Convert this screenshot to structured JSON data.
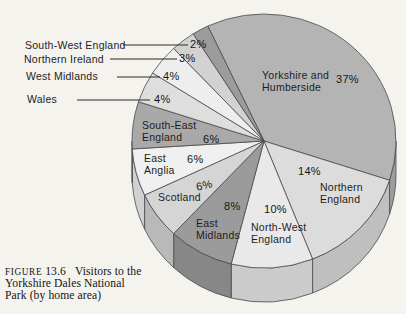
{
  "caption": {
    "figure_word": "FIGURE",
    "figure_number": "13.6",
    "line1": "Visitors to the",
    "line2": "Yorkshire Dales National",
    "line3": "Park (by home area)"
  },
  "chart_data": {
    "type": "pie",
    "style": "3d-extruded",
    "title": "Visitors to the Yorkshire Dales National Park (by home area)",
    "units": "percent of visitors",
    "start_angle_deg": -25.2,
    "depth_px": 34,
    "edge_stroke": "#4a4a4a",
    "leader_stroke": "#2b2b2b",
    "background": "#f5f3ee",
    "legend_position": "none",
    "segments": [
      {
        "name": "Yorkshire and Humberside",
        "value": 37,
        "pct": "37%",
        "color": "#b4b4b4",
        "label": {
          "lines": [
            "Yorkshire and",
            "Humberside"
          ],
          "x": 262,
          "y": 69
        },
        "pct_pos": {
          "x": 336,
          "y": 74
        }
      },
      {
        "name": "Northern England",
        "value": 14,
        "pct": "14%",
        "color": "#dcdcdc",
        "label": {
          "lines": [
            "Northern",
            "England"
          ],
          "x": 320,
          "y": 181
        },
        "pct_pos": {
          "x": 298,
          "y": 166
        }
      },
      {
        "name": "North-West England",
        "value": 10,
        "pct": "10%",
        "color": "#e9e9e9",
        "label": {
          "lines": [
            "North-West",
            "England"
          ],
          "x": 251,
          "y": 221
        },
        "pct_pos": {
          "x": 264,
          "y": 204
        }
      },
      {
        "name": "East Midlands",
        "value": 8,
        "pct": "8%",
        "color": "#9b9b9b",
        "label": {
          "lines": [
            "East",
            "Midlands"
          ],
          "x": 196,
          "y": 217
        },
        "pct_pos": {
          "x": 224,
          "y": 201
        }
      },
      {
        "name": "Scotland",
        "value": 6,
        "pct": "6%",
        "color": "#d5d5d5",
        "label": {
          "lines": [
            "Scotland"
          ],
          "x": 158,
          "y": 191
        },
        "pct_pos": {
          "x": 196,
          "y": 180
        },
        "pct_rotate": -12
      },
      {
        "name": "East Anglia",
        "value": 6,
        "pct": "6%",
        "color": "#f0f0f0",
        "label": {
          "lines": [
            "East",
            "Anglia"
          ],
          "x": 144,
          "y": 152
        },
        "pct_pos": {
          "x": 187,
          "y": 154
        }
      },
      {
        "name": "South-East England",
        "value": 6,
        "pct": "6%",
        "color": "#a9a9a9",
        "label": {
          "lines": [
            "South-East",
            "England"
          ],
          "x": 142,
          "y": 119
        },
        "pct_pos": {
          "x": 203,
          "y": 134
        }
      },
      {
        "name": "Wales",
        "value": 4,
        "pct": "4%",
        "color": "#dedede",
        "callout": {
          "x": 27,
          "y": 93,
          "line": [
            77,
            100,
            150,
            100
          ]
        },
        "pct_pos": {
          "x": 154,
          "y": 94
        }
      },
      {
        "name": "West Midlands",
        "value": 4,
        "pct": "4%",
        "color": "#eeeeee",
        "callout": {
          "x": 26,
          "y": 70,
          "line": [
            117,
            77,
            160,
            77
          ]
        },
        "pct_pos": {
          "x": 163,
          "y": 71
        }
      },
      {
        "name": "Northern Ireland",
        "value": 3,
        "pct": "3%",
        "color": "#d2d2d2",
        "callout": {
          "x": 24,
          "y": 53,
          "line": [
            110,
            59,
            177,
            59
          ]
        },
        "pct_pos": {
          "x": 179,
          "y": 53
        }
      },
      {
        "name": "South-West England",
        "value": 2,
        "pct": "2%",
        "color": "#9c9c9c",
        "callout": {
          "x": 25,
          "y": 39,
          "line": [
            123,
            45,
            188,
            45
          ]
        },
        "pct_pos": {
          "x": 190,
          "y": 39
        }
      }
    ]
  }
}
